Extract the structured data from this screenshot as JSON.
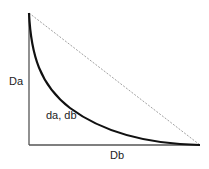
{
  "diagram": {
    "labels": {
      "y_axis": "Da",
      "x_axis": "Db",
      "curve": "da, db"
    },
    "colors": {
      "axis": "#555555",
      "curve": "#111111",
      "diagonal": "#888888",
      "text": "#222222"
    }
  }
}
